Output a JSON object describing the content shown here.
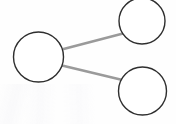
{
  "canvas": {
    "width": 176,
    "height": 124,
    "background_color": "#fefefe"
  },
  "diagram": {
    "type": "node-link-graph",
    "title": "",
    "node_stroke_color": "#2e2e2e",
    "node_fill_color": "#ffffff",
    "node_stroke_width": 1.4,
    "edge_color": "#9a9a9a",
    "edge_width": 2.6,
    "nodes": [
      {
        "id": "node-hub",
        "label": "",
        "cx": 38.5,
        "cy": 57,
        "r": 25,
        "role": "hub"
      },
      {
        "id": "node-top-right",
        "label": "",
        "cx": 142,
        "cy": 21,
        "r": 23,
        "role": "leaf"
      },
      {
        "id": "node-bottom-right",
        "label": "",
        "cx": 142.5,
        "cy": 91,
        "r": 24,
        "role": "leaf"
      }
    ],
    "edges": [
      {
        "id": "edge-hub-to-top-right",
        "from": "node-hub",
        "to": "node-top-right",
        "label": "",
        "x1": 62.6,
        "y1": 49.2,
        "x2": 123.0,
        "y2": 33.5
      },
      {
        "id": "edge-hub-to-bottom-right",
        "from": "node-hub",
        "to": "node-bottom-right",
        "label": "",
        "x1": 62.0,
        "y1": 65.5,
        "x2": 122.5,
        "y2": 80.0
      }
    ]
  }
}
